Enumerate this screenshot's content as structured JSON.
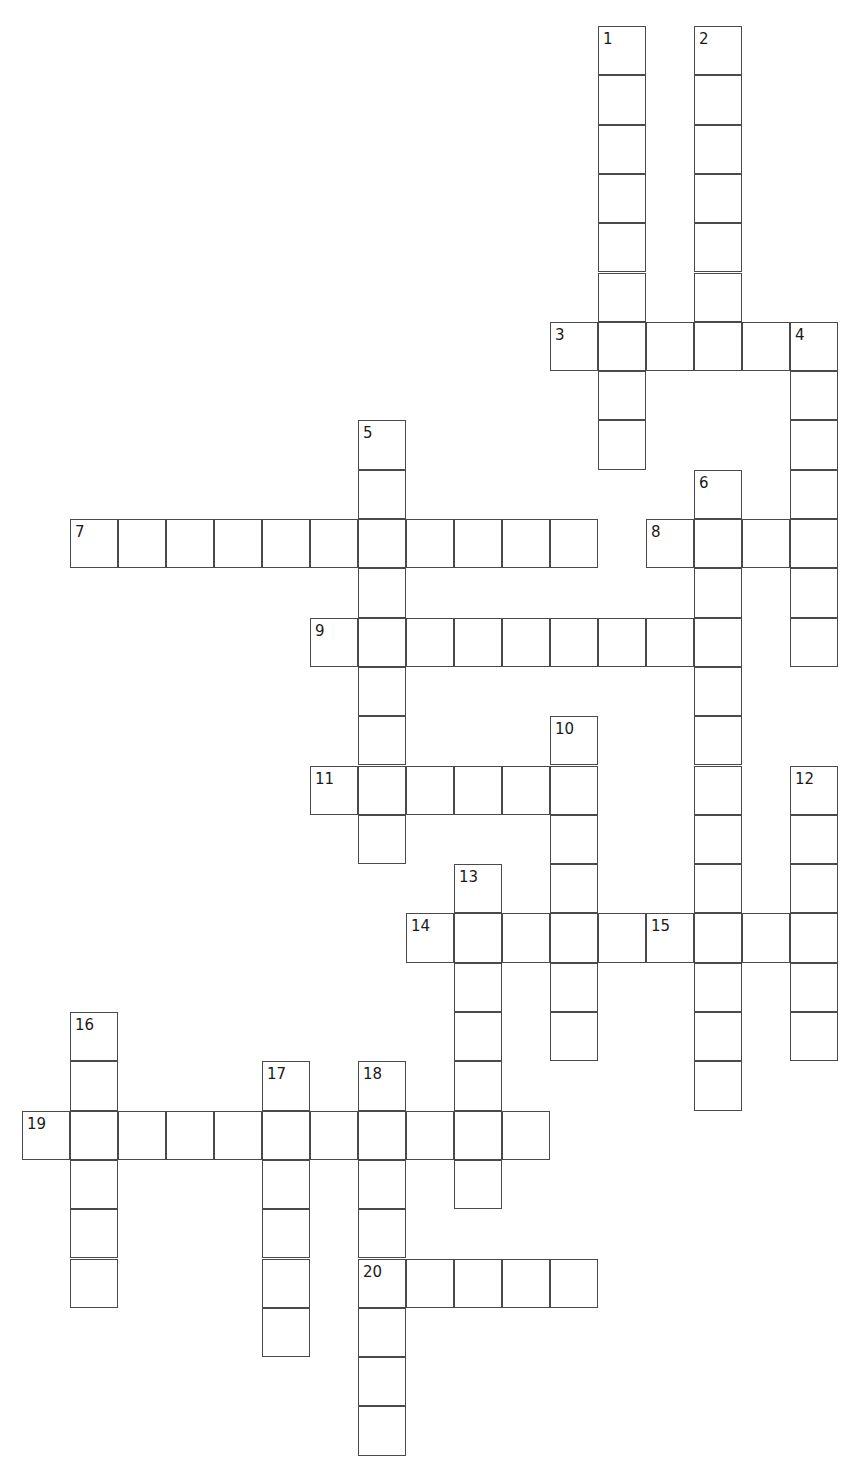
{
  "puzzle": {
    "title": "Crossword Puzzle Grid",
    "grid": {
      "origin_x": 22,
      "origin_y": 26,
      "cell_width": 48,
      "cell_height": 49.3,
      "border_color": "#4a4a4a",
      "cell_color": "#ffffff",
      "number_color": "#1a1a1a",
      "columns": 18,
      "rows": 30
    },
    "entries": [
      {
        "number": "1",
        "direction": "down",
        "row": 0,
        "col": 12,
        "length": 9
      },
      {
        "number": "2",
        "direction": "down",
        "row": 0,
        "col": 14,
        "length": 7
      },
      {
        "number": "3",
        "direction": "across",
        "row": 6,
        "col": 11,
        "length": 6
      },
      {
        "number": "4",
        "direction": "down",
        "row": 6,
        "col": 16,
        "length": 7
      },
      {
        "number": "5",
        "direction": "down",
        "row": 8,
        "col": 7,
        "length": 9
      },
      {
        "number": "6",
        "direction": "down",
        "row": 9,
        "col": 14,
        "length": 13
      },
      {
        "number": "7",
        "direction": "across",
        "row": 10,
        "col": 1,
        "length": 11
      },
      {
        "number": "8",
        "direction": "across",
        "row": 10,
        "col": 13,
        "length": 4
      },
      {
        "number": "9",
        "direction": "across",
        "row": 12,
        "col": 6,
        "length": 9
      },
      {
        "number": "10",
        "direction": "down",
        "row": 14,
        "col": 11,
        "length": 7
      },
      {
        "number": "11",
        "direction": "across",
        "row": 15,
        "col": 6,
        "length": 6
      },
      {
        "number": "12",
        "direction": "down",
        "row": 15,
        "col": 16,
        "length": 6
      },
      {
        "number": "13",
        "direction": "down",
        "row": 17,
        "col": 9,
        "length": 7
      },
      {
        "number": "14",
        "direction": "across",
        "row": 18,
        "col": 8,
        "length": 9
      },
      {
        "number": "15",
        "direction": "across",
        "row": 18,
        "col": 13,
        "length": 4
      },
      {
        "number": "16",
        "direction": "down",
        "row": 20,
        "col": 1,
        "length": 6
      },
      {
        "number": "17",
        "direction": "down",
        "row": 21,
        "col": 5,
        "length": 6
      },
      {
        "number": "18",
        "direction": "down",
        "row": 21,
        "col": 7,
        "length": 8
      },
      {
        "number": "19",
        "direction": "across",
        "row": 22,
        "col": 0,
        "length": 11
      },
      {
        "number": "20",
        "direction": "across",
        "row": 25,
        "col": 7,
        "length": 5
      }
    ]
  }
}
